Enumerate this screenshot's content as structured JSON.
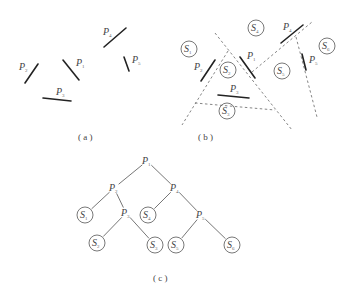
{
  "panel_a": {
    "caption": "( a )",
    "caption_pos": [
      78,
      140
    ],
    "segments": [
      {
        "id": "P1",
        "x1": 63,
        "y1": 60,
        "x2": 79,
        "y2": 80,
        "label": "P",
        "sub": "1",
        "lx": 76,
        "ly": 66
      },
      {
        "id": "P2",
        "x1": 25,
        "y1": 83,
        "x2": 38,
        "y2": 64,
        "label": "P",
        "sub": "2",
        "lx": 19,
        "ly": 70
      },
      {
        "id": "P3",
        "x1": 43,
        "y1": 98,
        "x2": 71,
        "y2": 101,
        "label": "P",
        "sub": "3",
        "lx": 56,
        "ly": 95
      },
      {
        "id": "P4",
        "x1": 104,
        "y1": 47,
        "x2": 126,
        "y2": 28,
        "label": "P",
        "sub": "4",
        "lx": 103,
        "ly": 35
      },
      {
        "id": "P5",
        "x1": 124,
        "y1": 57,
        "x2": 129,
        "y2": 71,
        "label": "P",
        "sub": "5",
        "lx": 132,
        "ly": 63
      }
    ]
  },
  "panel_b": {
    "caption": "( b )",
    "caption_pos": [
      198,
      140
    ],
    "segments": [
      {
        "id": "P1",
        "x1": 240,
        "y1": 57,
        "x2": 255,
        "y2": 78,
        "label": "P",
        "sub": "1",
        "lx": 247,
        "ly": 59
      },
      {
        "id": "P2",
        "x1": 201,
        "y1": 81,
        "x2": 215,
        "y2": 60,
        "label": "P",
        "sub": "2",
        "lx": 194,
        "ly": 70
      },
      {
        "id": "P3",
        "x1": 218,
        "y1": 95,
        "x2": 249,
        "y2": 98,
        "label": "P",
        "sub": "3",
        "lx": 230,
        "ly": 92
      },
      {
        "id": "P4",
        "x1": 281,
        "y1": 43,
        "x2": 303,
        "y2": 25,
        "label": "P",
        "sub": "4",
        "lx": 283,
        "ly": 30
      },
      {
        "id": "P5",
        "x1": 302,
        "y1": 54,
        "x2": 306,
        "y2": 70,
        "label": "P",
        "sub": "5",
        "lx": 309,
        "ly": 63
      }
    ],
    "dashed_lines": [
      {
        "x1": 215,
        "y1": 33,
        "x2": 292,
        "y2": 130
      },
      {
        "x1": 228,
        "y1": 51,
        "x2": 182,
        "y2": 125
      },
      {
        "x1": 195,
        "y1": 103,
        "x2": 275,
        "y2": 110
      },
      {
        "x1": 252,
        "y1": 72,
        "x2": 312,
        "y2": 22
      },
      {
        "x1": 296,
        "y1": 37,
        "x2": 317,
        "y2": 117
      }
    ],
    "regions": [
      {
        "label": "S",
        "sub": "1",
        "cx": 189,
        "cy": 49
      },
      {
        "label": "S",
        "sub": "2",
        "cx": 228,
        "cy": 70
      },
      {
        "label": "S",
        "sub": "3",
        "cx": 227,
        "cy": 111
      },
      {
        "label": "S",
        "sub": "4",
        "cx": 256,
        "cy": 28
      },
      {
        "label": "S",
        "sub": "5",
        "cx": 282,
        "cy": 71
      },
      {
        "label": "S",
        "sub": "6",
        "cx": 327,
        "cy": 46
      }
    ]
  },
  "panel_c": {
    "caption": "( c )",
    "caption_pos": [
      153,
      281
    ],
    "nodes": [
      {
        "id": "P1",
        "type": "plane",
        "label": "P",
        "sub": "1",
        "x": 147,
        "y": 161
      },
      {
        "id": "P2",
        "type": "plane",
        "label": "P",
        "sub": "2",
        "x": 114,
        "y": 188
      },
      {
        "id": "P4",
        "type": "plane",
        "label": "P",
        "sub": "4",
        "x": 175,
        "y": 188
      },
      {
        "id": "S1",
        "type": "region",
        "label": "S",
        "sub": "1",
        "x": 85,
        "y": 215
      },
      {
        "id": "P3",
        "type": "plane",
        "label": "P",
        "sub": "3",
        "x": 126,
        "y": 213
      },
      {
        "id": "S4",
        "type": "region",
        "label": "S",
        "sub": "4",
        "x": 148,
        "y": 215
      },
      {
        "id": "P5",
        "type": "plane",
        "label": "P",
        "sub": "5",
        "x": 201,
        "y": 215
      },
      {
        "id": "S2",
        "type": "region",
        "label": "S",
        "sub": "2",
        "x": 97,
        "y": 243
      },
      {
        "id": "S3",
        "type": "region",
        "label": "S",
        "sub": "3",
        "x": 155,
        "y": 245
      },
      {
        "id": "S5",
        "type": "region",
        "label": "S",
        "sub": "5",
        "x": 176,
        "y": 245
      },
      {
        "id": "S6",
        "type": "region",
        "label": "S",
        "sub": "6",
        "x": 232,
        "y": 245
      }
    ],
    "edges": [
      [
        "P1",
        "P2"
      ],
      [
        "P1",
        "P4"
      ],
      [
        "P2",
        "S1"
      ],
      [
        "P2",
        "P3"
      ],
      [
        "P3",
        "S2"
      ],
      [
        "P3",
        "S3"
      ],
      [
        "P4",
        "S4"
      ],
      [
        "P4",
        "P5"
      ],
      [
        "P5",
        "S5"
      ],
      [
        "P5",
        "S6"
      ]
    ]
  }
}
